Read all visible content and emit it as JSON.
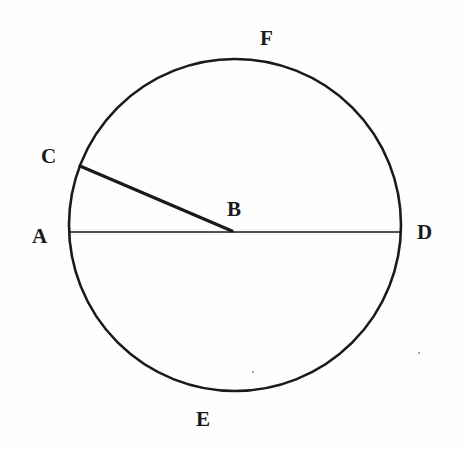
{
  "figure": {
    "background_color": "#fefefe",
    "stroke_color": "#1a1a1a",
    "width": 464,
    "height": 454
  },
  "chart_data": {
    "type": "diagram",
    "subtype": "euclidean-circle",
    "canvas": {
      "width": 464,
      "height": 454
    },
    "circle": {
      "center": {
        "x": 235,
        "y": 225
      },
      "radius": 166,
      "stroke_width": 2.6,
      "stroke": "#1a1a1a",
      "fill": "none"
    },
    "points": [
      {
        "name": "A",
        "x": 69,
        "y": 232,
        "on": "circle",
        "label_x": 32,
        "label_y": 226
      },
      {
        "name": "B",
        "x": 232,
        "y": 231,
        "on": "center",
        "label_x": 227,
        "label_y": 199
      },
      {
        "name": "C",
        "x": 80,
        "y": 166,
        "on": "circle",
        "label_x": 41,
        "label_y": 146
      },
      {
        "name": "D",
        "x": 401,
        "y": 232,
        "on": "circle",
        "label_x": 417,
        "label_y": 222
      },
      {
        "name": "E",
        "x": 235,
        "y": 393,
        "on": "circle",
        "label_x": 196,
        "label_y": 409
      },
      {
        "name": "F",
        "x": 240,
        "y": 57,
        "on": "circle",
        "label_x": 260,
        "label_y": 28
      }
    ],
    "segments": [
      {
        "name": "AD",
        "role": "diameter",
        "from": {
          "x": 69,
          "y": 232
        },
        "to": {
          "x": 401,
          "y": 232
        },
        "stroke_width": 1.6,
        "stroke": "#1a1a1a"
      },
      {
        "name": "CB",
        "role": "radius",
        "from": {
          "x": 80,
          "y": 166
        },
        "to": {
          "x": 232,
          "y": 231
        },
        "stroke_width": 3.2,
        "stroke": "#1a1a1a"
      }
    ],
    "labels": [
      "A",
      "B",
      "C",
      "D",
      "E",
      "F"
    ],
    "grid": false,
    "legend": false,
    "axes": false
  },
  "labels": {
    "a": "A",
    "b": "B",
    "c": "C",
    "d": "D",
    "e": "E",
    "f": "F"
  }
}
